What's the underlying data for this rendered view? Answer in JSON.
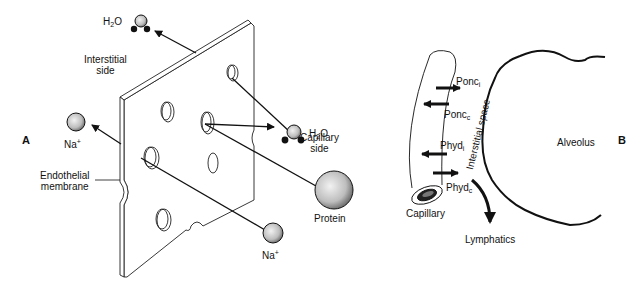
{
  "panels": {
    "a": {
      "label": "A"
    },
    "b": {
      "label": "B"
    }
  },
  "panel_a": {
    "membrane_label_line1": "Endothelial",
    "membrane_label_line2": "membrane",
    "interstitial_line1": "Interstitial",
    "interstitial_line2": "side",
    "capillary_line1": "Capillary",
    "capillary_line2": "side",
    "molecules": {
      "water_top": {
        "base": "H",
        "sub": "2",
        "rest": "O"
      },
      "water_right": {
        "base": "H",
        "sub": "2",
        "rest": "O"
      },
      "sodium_left": {
        "base": "Na",
        "sup": "+"
      },
      "sodium_bottom": {
        "base": "Na",
        "sup": "+"
      },
      "protein": {
        "label": "Protein"
      }
    }
  },
  "panel_b": {
    "forces": [
      {
        "base": "Ponc",
        "sub": "i",
        "direction": "right"
      },
      {
        "base": "Ponc",
        "sub": "c",
        "direction": "left"
      },
      {
        "base": "Phyd",
        "sub": "i",
        "direction": "left"
      },
      {
        "base": "Phyd",
        "sub": "c",
        "direction": "right"
      }
    ],
    "interstitial_space": "Interstitial space",
    "alveolus": "Alveolus",
    "capillary": "Capillary",
    "lymphatics": "Lymphatics"
  }
}
